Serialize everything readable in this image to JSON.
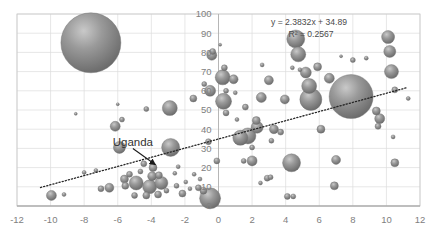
{
  "chart_data": {
    "type": "scatter",
    "title": "",
    "subtitle": "",
    "xlabel": "",
    "ylabel": "",
    "xlim": [
      -12,
      12
    ],
    "ylim": [
      0,
      100
    ],
    "xticks": [
      "-12",
      "-10",
      "-8",
      "-6",
      "-4",
      "-2",
      "0",
      "2",
      "4",
      "6",
      "8",
      "10",
      "12"
    ],
    "yticks": [
      "0",
      "10",
      "20",
      "30",
      "40",
      "50",
      "60",
      "70",
      "80",
      "90",
      "100"
    ],
    "grid": true,
    "legend": "none",
    "bubble_color": "#808080",
    "trendline": {
      "style": "dotted",
      "color": "#262626",
      "equation": "y = 2.3832x + 34.89",
      "r_squared": "R² = 0.2567",
      "slope": 2.3832,
      "intercept": 34.89,
      "r2_value": 0.2567
    },
    "annotations": [
      {
        "label": "Uganda",
        "text_x": -5.1,
        "text_y": 31.5,
        "point_x": -3.75,
        "point_y": 21.5
      }
    ],
    "points": [
      {
        "x": -7.6,
        "y": 85.0,
        "r": 30.0
      },
      {
        "x": -2.9,
        "y": 51.0,
        "r": 7.5
      },
      {
        "x": -4.3,
        "y": 50.5,
        "r": 2.5
      },
      {
        "x": -1.5,
        "y": 56.0,
        "r": 3.5
      },
      {
        "x": -0.85,
        "y": 63.5,
        "r": 2.5
      },
      {
        "x": -0.5,
        "y": 60.0,
        "r": 5.5
      },
      {
        "x": -0.4,
        "y": 78.5,
        "r": 5.0
      },
      {
        "x": -0.35,
        "y": 80.5,
        "r": 3.0
      },
      {
        "x": 0.45,
        "y": 60.0,
        "r": 2.5
      },
      {
        "x": 1.0,
        "y": 59.0,
        "r": 2.0
      },
      {
        "x": 0.35,
        "y": 72.0,
        "r": 3.0
      },
      {
        "x": 0.25,
        "y": 67.0,
        "r": 7.5
      },
      {
        "x": 0.9,
        "y": 66.0,
        "r": 4.5
      },
      {
        "x": 0.3,
        "y": 54.5,
        "r": 8.0
      },
      {
        "x": 0.45,
        "y": 48.5,
        "r": 3.0
      },
      {
        "x": 1.6,
        "y": 51.5,
        "r": 3.0
      },
      {
        "x": 2.6,
        "y": 73.5,
        "r": 2.0
      },
      {
        "x": 3.0,
        "y": 65.5,
        "r": 4.5
      },
      {
        "x": 2.55,
        "y": 56.5,
        "r": 5.0
      },
      {
        "x": 3.95,
        "y": 55.5,
        "r": 4.5
      },
      {
        "x": 5.2,
        "y": 69.5,
        "r": 5.5
      },
      {
        "x": 5.4,
        "y": 62.5,
        "r": 7.5
      },
      {
        "x": 5.5,
        "y": 55.5,
        "r": 11.0
      },
      {
        "x": 5.9,
        "y": 72.5,
        "r": 4.0
      },
      {
        "x": 4.4,
        "y": 72.0,
        "r": 2.0
      },
      {
        "x": 4.85,
        "y": 71.0,
        "r": 2.0
      },
      {
        "x": 4.6,
        "y": 87.0,
        "r": 9.0
      },
      {
        "x": 4.75,
        "y": 79.0,
        "r": 7.5
      },
      {
        "x": 7.9,
        "y": 57.0,
        "r": 22.0
      },
      {
        "x": 6.6,
        "y": 66.5,
        "r": 5.0
      },
      {
        "x": 9.6,
        "y": 45.5,
        "r": 5.0
      },
      {
        "x": 9.5,
        "y": 41.5,
        "r": 3.0
      },
      {
        "x": 9.4,
        "y": 49.5,
        "r": 4.0
      },
      {
        "x": 10.1,
        "y": 88.0,
        "r": 6.5
      },
      {
        "x": 10.2,
        "y": 80.5,
        "r": 6.0
      },
      {
        "x": 10.3,
        "y": 70.0,
        "r": 7.0
      },
      {
        "x": 10.5,
        "y": 60.5,
        "r": 3.0
      },
      {
        "x": 10.4,
        "y": 36.0,
        "r": 2.0
      },
      {
        "x": 10.5,
        "y": 22.5,
        "r": 4.0
      },
      {
        "x": 11.3,
        "y": 56.0,
        "r": 2.0
      },
      {
        "x": 6.1,
        "y": 40.0,
        "r": 4.0
      },
      {
        "x": 4.35,
        "y": 22.5,
        "r": 9.0
      },
      {
        "x": 7.0,
        "y": 24.0,
        "r": 4.5
      },
      {
        "x": 6.9,
        "y": 10.5,
        "r": 4.0
      },
      {
        "x": 4.1,
        "y": 5.0,
        "r": 3.0
      },
      {
        "x": 4.45,
        "y": 5.0,
        "r": 2.5
      },
      {
        "x": 2.9,
        "y": 14.5,
        "r": 3.0
      },
      {
        "x": 3.1,
        "y": 15.0,
        "r": 2.5
      },
      {
        "x": 2.5,
        "y": 12.0,
        "r": 2.0
      },
      {
        "x": 2.0,
        "y": 23.5,
        "r": 5.0
      },
      {
        "x": 2.0,
        "y": 30.5,
        "r": 2.5
      },
      {
        "x": 1.5,
        "y": 23.5,
        "r": 2.5
      },
      {
        "x": 1.3,
        "y": 35.5,
        "r": 7.5
      },
      {
        "x": 1.75,
        "y": 36.5,
        "r": 8.0
      },
      {
        "x": 2.3,
        "y": 41.0,
        "r": 6.0
      },
      {
        "x": 2.25,
        "y": 44.5,
        "r": 4.0
      },
      {
        "x": 3.3,
        "y": 40.0,
        "r": 4.5
      },
      {
        "x": 3.15,
        "y": 34.0,
        "r": 2.5
      },
      {
        "x": 3.7,
        "y": 38.5,
        "r": 3.0
      },
      {
        "x": 1.1,
        "y": 45.0,
        "r": 2.0
      },
      {
        "x": -0.1,
        "y": 23.5,
        "r": 3.0
      },
      {
        "x": -0.6,
        "y": 33.5,
        "r": 3.0
      },
      {
        "x": -0.5,
        "y": 4.0,
        "r": 10.5
      },
      {
        "x": -0.9,
        "y": 8.0,
        "r": 3.5
      },
      {
        "x": -1.2,
        "y": 9.5,
        "r": 3.0
      },
      {
        "x": -1.7,
        "y": 9.0,
        "r": 2.0
      },
      {
        "x": -2.15,
        "y": 6.5,
        "r": 3.5
      },
      {
        "x": -2.5,
        "y": 10.5,
        "r": 2.5
      },
      {
        "x": -2.85,
        "y": 30.5,
        "r": 9.0
      },
      {
        "x": -3.1,
        "y": 8.0,
        "r": 2.5
      },
      {
        "x": -3.4,
        "y": 12.0,
        "r": 6.5
      },
      {
        "x": -3.55,
        "y": 16.0,
        "r": 3.5
      },
      {
        "x": -3.6,
        "y": 6.0,
        "r": 3.5
      },
      {
        "x": -3.9,
        "y": 20.0,
        "r": 4.0
      },
      {
        "x": -3.95,
        "y": 15.5,
        "r": 4.5
      },
      {
        "x": -4.1,
        "y": 10.0,
        "r": 7.0
      },
      {
        "x": -4.3,
        "y": 5.5,
        "r": 3.5
      },
      {
        "x": -4.45,
        "y": 22.0,
        "r": 3.0
      },
      {
        "x": -4.65,
        "y": 18.0,
        "r": 2.5
      },
      {
        "x": -4.9,
        "y": 12.0,
        "r": 7.0
      },
      {
        "x": -5.0,
        "y": 5.5,
        "r": 3.0
      },
      {
        "x": -5.3,
        "y": 16.5,
        "r": 3.0
      },
      {
        "x": -5.6,
        "y": 14.0,
        "r": 4.0
      },
      {
        "x": -5.55,
        "y": 10.5,
        "r": 3.5
      },
      {
        "x": -5.9,
        "y": 30.5,
        "r": 6.0
      },
      {
        "x": -6.15,
        "y": 41.5,
        "r": 5.0
      },
      {
        "x": -5.75,
        "y": 45.0,
        "r": 2.5
      },
      {
        "x": -6.5,
        "y": 9.5,
        "r": 4.5
      },
      {
        "x": -7.0,
        "y": 9.0,
        "r": 3.0
      },
      {
        "x": -7.3,
        "y": 18.5,
        "r": 2.0
      },
      {
        "x": -8.0,
        "y": 17.5,
        "r": 2.0
      },
      {
        "x": -9.2,
        "y": 6.0,
        "r": 2.0
      },
      {
        "x": -9.95,
        "y": 5.5,
        "r": 5.0
      },
      {
        "x": -2.4,
        "y": 20.5,
        "r": 2.0
      },
      {
        "x": -2.6,
        "y": 17.0,
        "r": 2.0
      },
      {
        "x": -1.45,
        "y": 16.5,
        "r": 2.0
      },
      {
        "x": -1.1,
        "y": 14.0,
        "r": 2.0
      },
      {
        "x": -1.95,
        "y": 12.5,
        "r": 2.0
      },
      {
        "x": -6.0,
        "y": 53.0,
        "r": 1.5
      },
      {
        "x": -8.5,
        "y": 48.0,
        "r": 1.5
      },
      {
        "x": 0.1,
        "y": 84.0,
        "r": 1.5
      },
      {
        "x": 8.8,
        "y": 77.0,
        "r": 2.0
      },
      {
        "x": 8.0,
        "y": 76.0,
        "r": 2.5
      },
      {
        "x": 7.3,
        "y": 78.0,
        "r": 1.5
      }
    ]
  }
}
